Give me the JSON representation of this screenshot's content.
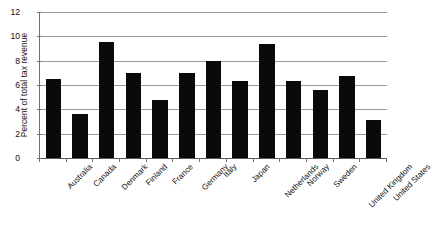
{
  "chart_data": {
    "type": "bar",
    "title": "",
    "xlabel": "",
    "ylabel": "Percent of total tax revenue",
    "ylim": [
      0,
      12
    ],
    "yticks": [
      0,
      2,
      4,
      6,
      8,
      10,
      12
    ],
    "grid": true,
    "legend": "none",
    "bar_color": "#0b0a0a",
    "categories": [
      "Australia",
      "Canada",
      "Denmark",
      "Finland",
      "France",
      "Germany",
      "Italy",
      "Japan",
      "Netherlands",
      "Norway",
      "Sweden",
      "United Kingdom",
      "United States"
    ],
    "values": [
      6.5,
      3.6,
      9.5,
      7.0,
      4.8,
      7.0,
      8.0,
      6.3,
      9.4,
      6.3,
      5.6,
      6.7,
      3.1
    ]
  },
  "source_note": ""
}
